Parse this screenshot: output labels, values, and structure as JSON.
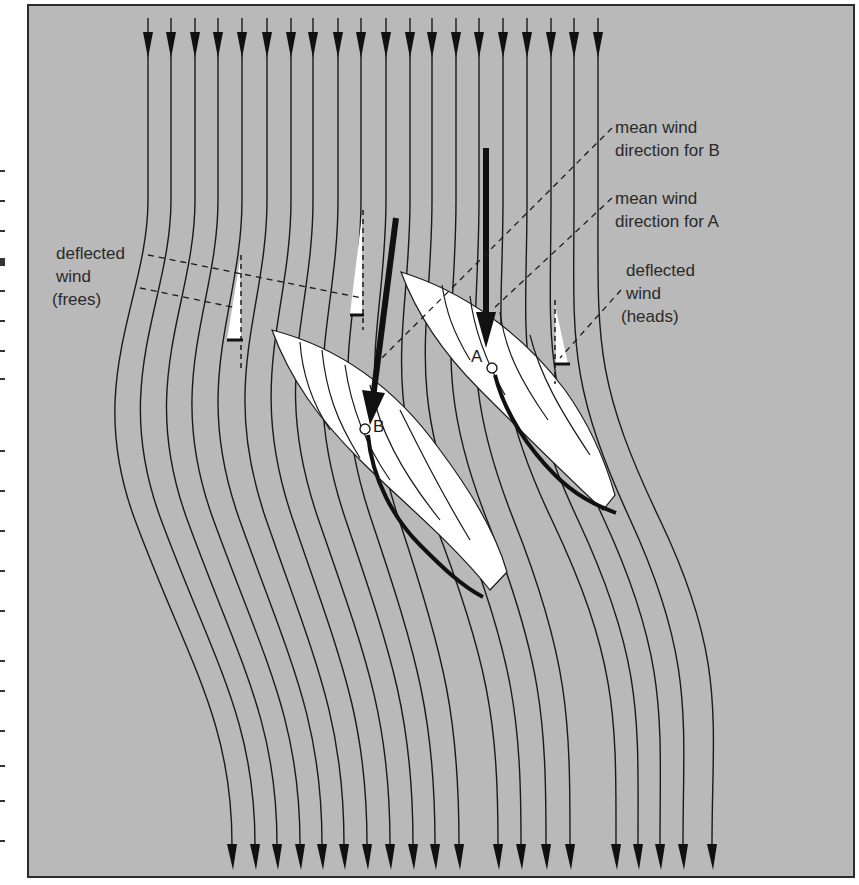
{
  "diagram": {
    "colors": {
      "background": "#b9b9b9",
      "frame": "#2b2b2b",
      "streamline": "#1a1a1a",
      "hull": "#ffffff",
      "sail": "#111111",
      "mean_wind_arrow": "#111111"
    },
    "boats": [
      {
        "id": "A",
        "label": "A"
      },
      {
        "id": "B",
        "label": "B"
      }
    ],
    "labels": {
      "mean_wind_b_line1": "mean wind",
      "mean_wind_b_line2": "direction for B",
      "mean_wind_a_line1": "mean wind",
      "mean_wind_a_line2": "direction for A",
      "heads_line1": "deflected",
      "heads_line2": "wind",
      "heads_line3": "(heads)",
      "frees_line1": "deflected",
      "frees_line2": "wind",
      "frees_line3": "(frees)"
    },
    "streamlines": {
      "count_top": 20,
      "count_bottom": 20,
      "top_arrow_x": [
        148,
        171,
        195,
        218,
        242,
        267,
        291,
        313,
        338,
        361,
        386,
        410,
        432,
        456,
        479,
        503,
        527,
        551,
        574,
        598
      ],
      "bottom_arrow_x": [
        232,
        255,
        277,
        300,
        322,
        344,
        367,
        390,
        413,
        435,
        459,
        498,
        521,
        546,
        570,
        616,
        638,
        660,
        683,
        712
      ]
    }
  }
}
